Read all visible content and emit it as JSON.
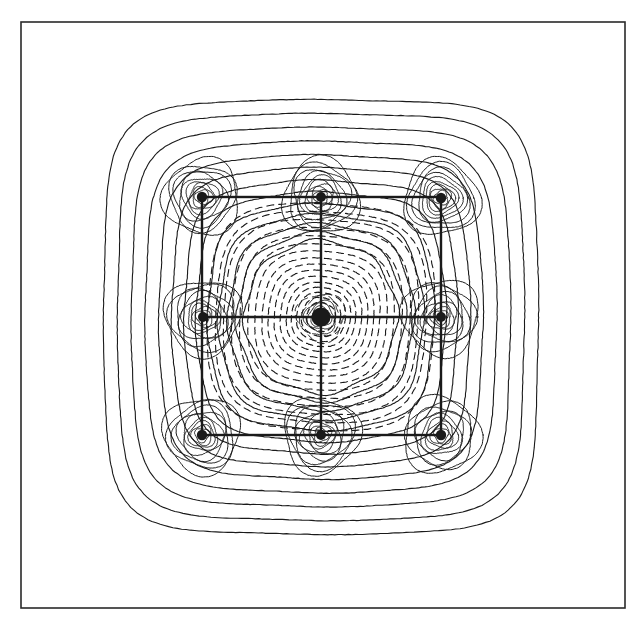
{
  "figure": {
    "kind": "contour-plot",
    "partial_caption_above": "19  4",
    "background_color": "#ffffff",
    "line_color": "#1a1a1a",
    "frame": {
      "x": 21,
      "y": 22,
      "width": 604,
      "height": 586,
      "stroke_width": 1.6,
      "color": "#2a2a2a"
    }
  },
  "chart_data": {
    "type": "line",
    "subtype": "contour-map",
    "title": "",
    "subtitle": "",
    "xlabel": "",
    "ylabel": "",
    "grid": false,
    "legend": "none",
    "axis_ticks_visible": false,
    "tick_labels": [],
    "annotations": [],
    "xlim": [
      0,
      640
    ],
    "ylim": [
      0,
      624
    ],
    "center": {
      "x": 321,
      "y": 317
    },
    "field_extent": {
      "x_min": 105,
      "x_max": 537,
      "y_min": 107,
      "y_max": 525
    },
    "unit_cell": {
      "label": "unit-cell-square",
      "x": 202,
      "y": 197,
      "width": 239,
      "height": 238,
      "stroke_width": 2.4
    },
    "crosshair": {
      "label": "lattice-guide-lines",
      "horizontal_y": 317,
      "vertical_x": 321,
      "x_start": 202,
      "x_end": 441,
      "y_start": 197,
      "y_end": 435,
      "stroke_width": 2.4
    },
    "atom_sites": [
      {
        "name": "corner-top-left",
        "x": 202,
        "y": 197,
        "r": 5.2
      },
      {
        "name": "edge-top-center",
        "x": 321,
        "y": 197,
        "r": 5.0
      },
      {
        "name": "corner-top-right",
        "x": 441,
        "y": 198,
        "r": 5.2
      },
      {
        "name": "edge-middle-left",
        "x": 203,
        "y": 317,
        "r": 5.0
      },
      {
        "name": "center-atom",
        "x": 321,
        "y": 317,
        "r": 9.5
      },
      {
        "name": "edge-middle-right",
        "x": 441,
        "y": 317,
        "r": 5.0
      },
      {
        "name": "corner-bottom-left",
        "x": 202,
        "y": 435,
        "r": 5.2
      },
      {
        "name": "edge-bottom-center",
        "x": 321,
        "y": 435,
        "r": 5.0
      },
      {
        "name": "corner-bottom-right",
        "x": 441,
        "y": 435,
        "r": 5.2
      }
    ],
    "contour_style": {
      "outer_lines": "solid",
      "inner_lines": "dashed",
      "dash_pattern": "7 5",
      "stroke_width": 1.1,
      "dash_region_radius": 58,
      "description": "Solid contours denote positive values, dashed contours denote negative values."
    },
    "contour_levels": {
      "outer_superellipse_count": 13,
      "outer_radii": [
        216,
        202,
        188,
        174,
        160,
        147,
        134,
        122,
        110,
        99,
        89,
        80,
        72
      ],
      "inner_central_count": 16,
      "inner_radii": [
        112,
        104,
        96,
        88,
        80,
        72,
        65,
        58,
        52,
        46,
        40,
        34,
        29,
        24,
        19,
        14
      ],
      "atom_ring_count": 9,
      "atom_ring_radii": [
        38,
        33,
        28,
        24,
        20,
        16,
        13,
        10,
        7
      ]
    },
    "series": [
      {
        "name": "positive-contours",
        "style": "solid",
        "count": 13
      },
      {
        "name": "negative-contours",
        "style": "dashed",
        "count": 16
      },
      {
        "name": "atom-core-contours",
        "style": "solid",
        "count": 9
      }
    ]
  }
}
